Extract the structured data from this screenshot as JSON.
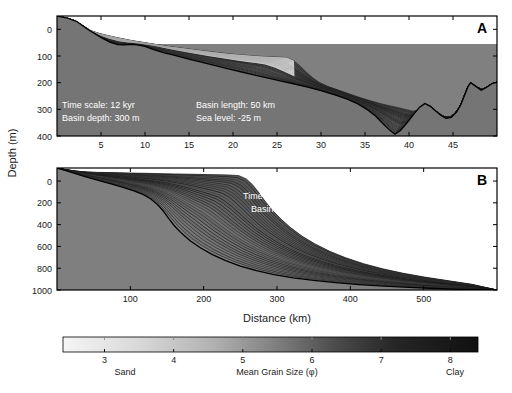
{
  "figure": {
    "background": "#ffffff",
    "axis_color": "#000000",
    "water_color": "#808080",
    "annotation_color": "#ffffff"
  },
  "axes": {
    "y_axis_title": "Depth (m)",
    "x_axis_title": "Distance (km)"
  },
  "panelA": {
    "letter": "A",
    "xticks": [
      5,
      10,
      15,
      20,
      25,
      30,
      35,
      40,
      45
    ],
    "yticks": [
      0,
      100,
      200,
      300,
      400
    ],
    "xlim": [
      0,
      50
    ],
    "ylim": [
      -50,
      400
    ],
    "annotations": {
      "time_scale": "Time scale: 12 kyr",
      "basin_depth": "Basin depth: 300 m",
      "basin_length": "Basin length: 50 km",
      "sea_level": "Sea level: -25 m"
    },
    "sea_level_depth": 55,
    "basement": [
      [
        0,
        -50
      ],
      [
        1.2,
        -42
      ],
      [
        2.2,
        -30
      ],
      [
        3.0,
        -12
      ],
      [
        3.6,
        2
      ],
      [
        4.4,
        18
      ],
      [
        5.2,
        34
      ],
      [
        6.0,
        48
      ],
      [
        6.9,
        57
      ],
      [
        7.6,
        58
      ],
      [
        8.4,
        56
      ],
      [
        9.1,
        58
      ],
      [
        10.0,
        64
      ],
      [
        11.0,
        76
      ],
      [
        12.2,
        88
      ],
      [
        13.5,
        99
      ],
      [
        15.0,
        112
      ],
      [
        16.5,
        124
      ],
      [
        18.0,
        136
      ],
      [
        19.5,
        148
      ],
      [
        21.0,
        160
      ],
      [
        22.5,
        172
      ],
      [
        24.0,
        183
      ],
      [
        25.5,
        194
      ],
      [
        27.0,
        205
      ],
      [
        28.5,
        217
      ],
      [
        30.0,
        230
      ],
      [
        31.5,
        245
      ],
      [
        33.0,
        262
      ],
      [
        34.2,
        280
      ],
      [
        35.2,
        300
      ],
      [
        36.2,
        325
      ],
      [
        37.0,
        352
      ],
      [
        37.8,
        378
      ],
      [
        38.4,
        393
      ],
      [
        39.0,
        380
      ],
      [
        39.8,
        350
      ],
      [
        40.5,
        320
      ],
      [
        41.2,
        292
      ],
      [
        41.8,
        278
      ],
      [
        42.4,
        288
      ],
      [
        43.0,
        305
      ],
      [
        43.6,
        322
      ],
      [
        44.2,
        334
      ],
      [
        44.8,
        330
      ],
      [
        45.4,
        310
      ],
      [
        45.9,
        282
      ],
      [
        46.3,
        248
      ],
      [
        46.7,
        215
      ],
      [
        47.0,
        200
      ],
      [
        47.6,
        214
      ],
      [
        48.2,
        228
      ],
      [
        48.8,
        218
      ],
      [
        49.4,
        204
      ],
      [
        50,
        198
      ]
    ],
    "surface": [
      [
        0,
        -50
      ],
      [
        1.2,
        -42
      ],
      [
        2.2,
        -30
      ],
      [
        3.0,
        -12
      ],
      [
        3.6,
        2
      ],
      [
        4.4,
        12
      ],
      [
        5.6,
        22
      ],
      [
        7.0,
        32
      ],
      [
        8.5,
        42
      ],
      [
        10.0,
        50
      ],
      [
        11.5,
        58
      ],
      [
        13.0,
        66
      ],
      [
        15.0,
        74
      ],
      [
        17.0,
        82
      ],
      [
        19.0,
        90
      ],
      [
        21.0,
        96
      ],
      [
        23.0,
        101
      ],
      [
        25.0,
        104
      ],
      [
        26.4,
        106
      ],
      [
        27.2,
        124
      ],
      [
        28.0,
        150
      ],
      [
        28.8,
        175
      ],
      [
        29.6,
        196
      ],
      [
        30.6,
        212
      ],
      [
        31.8,
        226
      ],
      [
        33.2,
        242
      ],
      [
        34.6,
        258
      ],
      [
        36.0,
        272
      ],
      [
        37.4,
        284
      ],
      [
        38.6,
        292
      ],
      [
        39.6,
        300
      ],
      [
        40.4,
        308
      ],
      [
        41.2,
        300
      ],
      [
        41.8,
        285
      ],
      [
        42.4,
        292
      ],
      [
        43.0,
        306
      ],
      [
        43.6,
        322
      ],
      [
        44.2,
        334
      ],
      [
        44.8,
        330
      ],
      [
        45.4,
        310
      ],
      [
        45.9,
        282
      ],
      [
        46.3,
        248
      ],
      [
        46.7,
        215
      ],
      [
        47.0,
        200
      ],
      [
        47.6,
        214
      ],
      [
        48.2,
        228
      ],
      [
        48.8,
        218
      ],
      [
        49.4,
        204
      ],
      [
        50,
        198
      ]
    ],
    "n_layers": 26,
    "sand_patch_color": "#d8d8d8"
  },
  "panelB": {
    "letter": "B",
    "xticks": [
      100,
      200,
      300,
      400,
      500
    ],
    "yticks": [
      0,
      200,
      400,
      600,
      800,
      1000
    ],
    "xlim": [
      0,
      600
    ],
    "ylim": [
      -120,
      1000
    ],
    "annotations": {
      "time_scale": "Time scale: 3 Myr",
      "basin_depth": "Basin depth: 1,000 m",
      "basin_length": "Basin length: 600 km",
      "sea_level": "Sea level: ±200 m"
    },
    "basement": [
      [
        0,
        -120
      ],
      [
        10,
        -100
      ],
      [
        22,
        -75
      ],
      [
        35,
        -48
      ],
      [
        48,
        -22
      ],
      [
        60,
        0
      ],
      [
        75,
        28
      ],
      [
        90,
        58
      ],
      [
        105,
        90
      ],
      [
        118,
        125
      ],
      [
        128,
        165
      ],
      [
        137,
        215
      ],
      [
        145,
        275
      ],
      [
        152,
        340
      ],
      [
        160,
        410
      ],
      [
        170,
        480
      ],
      [
        182,
        550
      ],
      [
        196,
        615
      ],
      [
        212,
        675
      ],
      [
        230,
        730
      ],
      [
        250,
        780
      ],
      [
        272,
        822
      ],
      [
        296,
        858
      ],
      [
        322,
        888
      ],
      [
        350,
        912
      ],
      [
        380,
        932
      ],
      [
        412,
        950
      ],
      [
        446,
        964
      ],
      [
        480,
        976
      ],
      [
        515,
        986
      ],
      [
        550,
        994
      ],
      [
        600,
        1000
      ]
    ],
    "surface": [
      [
        0,
        -120
      ],
      [
        12,
        -105
      ],
      [
        26,
        -92
      ],
      [
        40,
        -84
      ],
      [
        55,
        -80
      ],
      [
        70,
        -78
      ],
      [
        85,
        -76
      ],
      [
        100,
        -74
      ],
      [
        115,
        -72
      ],
      [
        130,
        -70
      ],
      [
        145,
        -68
      ],
      [
        160,
        -66
      ],
      [
        175,
        -64
      ],
      [
        190,
        -62
      ],
      [
        205,
        -60
      ],
      [
        220,
        -58
      ],
      [
        235,
        -56
      ],
      [
        248,
        -50
      ],
      [
        258,
        -20
      ],
      [
        266,
        30
      ],
      [
        274,
        95
      ],
      [
        282,
        170
      ],
      [
        292,
        255
      ],
      [
        304,
        340
      ],
      [
        318,
        425
      ],
      [
        334,
        505
      ],
      [
        352,
        578
      ],
      [
        372,
        645
      ],
      [
        394,
        705
      ],
      [
        418,
        758
      ],
      [
        444,
        805
      ],
      [
        472,
        846
      ],
      [
        502,
        882
      ],
      [
        534,
        915
      ],
      [
        566,
        948
      ],
      [
        600,
        1000
      ]
    ],
    "n_layers": 30
  },
  "colorbar": {
    "ticks": [
      {
        "value": 3,
        "label": "3"
      },
      {
        "value": 4,
        "label": "4"
      },
      {
        "value": 5,
        "label": "5"
      },
      {
        "value": 6,
        "label": "6"
      },
      {
        "value": 7,
        "label": "7"
      },
      {
        "value": 8,
        "label": "8"
      }
    ],
    "title": "Mean Grain Size (φ)",
    "left_label": "Sand",
    "right_label": "Clay",
    "range": [
      2.4,
      8.4
    ],
    "light_color": "#f2f2f2",
    "dark_color": "#111111"
  },
  "chart_data": {
    "type": "area",
    "xlabel": "Distance (km)",
    "ylabel": "Depth (m)",
    "panels": [
      {
        "name": "A",
        "xlim": [
          0,
          50
        ],
        "ylim": [
          400,
          -50
        ],
        "xticks": [
          5,
          10,
          15,
          20,
          25,
          30,
          35,
          40,
          45
        ],
        "yticks": [
          0,
          100,
          200,
          300,
          400
        ],
        "time_scale_kyr": 12,
        "basin_depth_m": 300,
        "basin_length_km": 50,
        "sea_level_m": -25
      },
      {
        "name": "B",
        "xlim": [
          0,
          600
        ],
        "ylim": [
          1000,
          -120
        ],
        "xticks": [
          100,
          200,
          300,
          400,
          500
        ],
        "yticks": [
          0,
          200,
          400,
          600,
          800,
          1000
        ],
        "time_scale_myr": 3,
        "basin_depth_m": 1000,
        "basin_length_km": 600,
        "sea_level_m": 200
      }
    ],
    "colorbar": {
      "label": "Mean Grain Size (φ)",
      "ticks": [
        3,
        4,
        5,
        6,
        7,
        8
      ],
      "low_end": "Sand",
      "high_end": "Clay"
    }
  }
}
